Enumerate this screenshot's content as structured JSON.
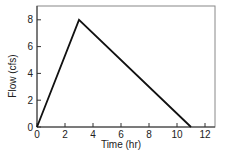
{
  "chart_data": {
    "type": "line",
    "title": "",
    "xlabel": "Time (hr)",
    "ylabel": "Flow (cfs)",
    "xlim": [
      0,
      12.7
    ],
    "ylim": [
      0,
      9
    ],
    "xticks": [
      0,
      2,
      4,
      6,
      8,
      10,
      12
    ],
    "yticks": [
      0,
      2,
      4,
      6,
      8
    ],
    "grid": false,
    "legend": null,
    "series": [
      {
        "name": "Hydrograph",
        "x": [
          0,
          3,
          11
        ],
        "y": [
          0,
          8,
          0
        ],
        "color": "#111111"
      }
    ]
  },
  "axes": {
    "x_label": "Time (hr)",
    "y_label": "Flow (cfs)",
    "x_tick_labels": [
      "0",
      "2",
      "4",
      "6",
      "8",
      "10",
      "12"
    ],
    "y_tick_labels": [
      "0",
      "2",
      "4",
      "6",
      "8"
    ]
  }
}
